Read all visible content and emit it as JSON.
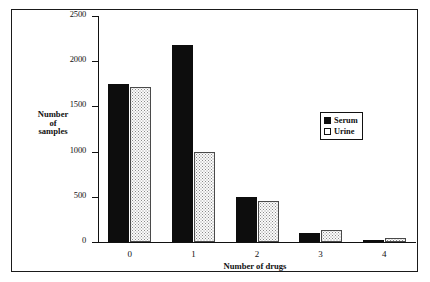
{
  "chart_data": {
    "type": "bar",
    "title": "",
    "xlabel": "Number of drugs",
    "ylabel": "Number of samples",
    "ylabel_lines": [
      "Number",
      "of",
      "samples"
    ],
    "categories": [
      "0",
      "1",
      "2",
      "3",
      "4"
    ],
    "series": [
      {
        "name": "Serum",
        "color": "#0d0d0d",
        "fill": "solid-black",
        "values": [
          1750,
          2180,
          500,
          100,
          5
        ]
      },
      {
        "name": "Urine",
        "color": "#ffffff",
        "fill": "dotted-white",
        "values": [
          1720,
          1000,
          450,
          130,
          40
        ]
      }
    ],
    "ylim": [
      0,
      2500
    ],
    "yticks": [
      0,
      500,
      1000,
      1500,
      2000,
      2500
    ],
    "ytick_labels": [
      "0",
      "500",
      "1000",
      "1500",
      "2000",
      "2500"
    ],
    "grid": false,
    "legend_position": "upper-right",
    "legend_entries": [
      "Serum",
      "Urine"
    ]
  },
  "figure": {
    "background": "#ffffff",
    "border_color": "#1a1a1a"
  }
}
